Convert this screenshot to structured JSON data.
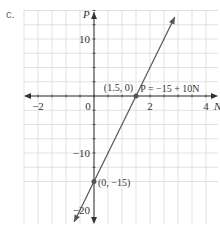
{
  "part_label": "c.",
  "chart_data": {
    "type": "line",
    "title": "",
    "xlabel": "N",
    "ylabel": "P",
    "xlim": [
      -2.5,
      4.4
    ],
    "ylim": [
      -22.5,
      15
    ],
    "grid": true,
    "x_ticks": [
      {
        "value": -2,
        "label": "−2"
      },
      {
        "value": 0,
        "label": "0"
      },
      {
        "value": 2,
        "label": "2"
      },
      {
        "value": 4,
        "label": "4"
      }
    ],
    "y_ticks": [
      {
        "value": 10,
        "label": "10"
      },
      {
        "value": -10,
        "label": "−10"
      },
      {
        "value": -20,
        "label": "−20"
      }
    ],
    "series": [
      {
        "name": "P = −15 + 10N",
        "equation": "P = −15 + 10N",
        "slope": 10,
        "intercept": -15,
        "x": [
          -0.7,
          3.3
        ],
        "values": [
          -22,
          18
        ],
        "color": "#555555"
      }
    ],
    "points": [
      {
        "x": 1.5,
        "y": 0,
        "label": "(1.5, 0)"
      },
      {
        "x": 0,
        "y": -15,
        "label": "(0, −15)"
      }
    ],
    "annotations": [
      {
        "text": "P = −15 + 10N",
        "x": 1.65,
        "y": 1.5
      }
    ]
  },
  "colors": {
    "grid": "#d9d9d9",
    "axis": "#333333",
    "line": "#555555",
    "text": "#333333"
  }
}
